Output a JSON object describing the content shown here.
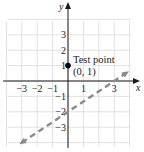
{
  "chart_data": {
    "type": "line",
    "title": "",
    "xlabel": "x",
    "ylabel": "y",
    "xlim": [
      -4,
      4
    ],
    "ylim": [
      -4,
      4
    ],
    "grid": true,
    "x_ticks": [
      -3,
      -2,
      -1,
      1,
      3
    ],
    "y_ticks": [
      3,
      2,
      1,
      -1,
      -2,
      -3
    ],
    "x_tick_labels": [
      "−3",
      "−2",
      "−1",
      "1",
      "3"
    ],
    "y_tick_labels": [
      "3",
      "2",
      "1",
      "−1",
      "−2",
      "−3"
    ],
    "series": [
      {
        "name": "boundary line",
        "style": "dashed",
        "color": "#8a8a8a",
        "equation": "y = (2/3)x - 2",
        "x": [
          -3,
          3.8
        ],
        "y": [
          -4,
          0.53
        ],
        "arrows": "both"
      }
    ],
    "points": [
      {
        "name": "test point",
        "x": 0,
        "y": 1,
        "color": "#000000"
      }
    ],
    "annotations": [
      {
        "text_line1": "Test point",
        "text_line2": "(0, 1)",
        "x": 0,
        "y": 1
      }
    ]
  }
}
